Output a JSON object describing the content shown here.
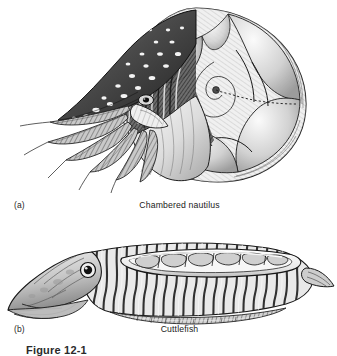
{
  "figure": {
    "caption": "Figure 12-1",
    "background_color": "#ffffff",
    "ink_color": "#2b2b2b"
  },
  "panels": [
    {
      "letter": "(a)",
      "title": "Chambered nautilus",
      "subject": "chambered-nautilus",
      "description": "Cutaway pen-and-ink illustration of a chambered nautilus showing the coiled external shell, internal gas-filled chambers separated by septa, the siphuncle, the dark spotted hood, and the tentacles projecting from the aperture.",
      "features": [
        "spotted hood",
        "tentacles",
        "funnel",
        "body chamber",
        "septa",
        "siphuncle",
        "spiral shell"
      ]
    },
    {
      "letter": "(b)",
      "title": "Cuttlefish",
      "subject": "cuttlefish",
      "description": "Lateral pen-and-ink illustration of a cuttlefish in cutaway showing the internal chambered cuttlebone beneath the mantle, the large eye, the striped mantle, the lateral fin and the arms.",
      "features": [
        "eye",
        "arms",
        "mantle stripes",
        "cuttlebone chambers",
        "lateral fin"
      ]
    }
  ]
}
